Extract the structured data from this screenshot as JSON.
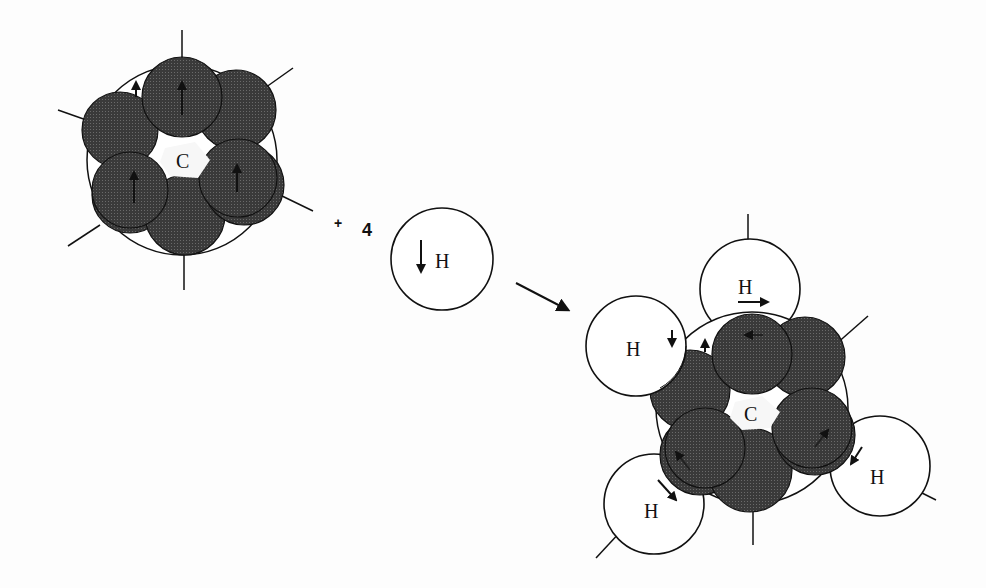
{
  "diagram": {
    "type": "reaction",
    "reactant_carbon": {
      "label": "C",
      "electron_spheres": 8,
      "spin_arrows": [
        "up",
        "up",
        "up",
        "up"
      ]
    },
    "operator": "+",
    "coefficient": "4",
    "reactant_hydrogen": {
      "label": "H",
      "spin_arrow": "down"
    },
    "reaction_arrow": "→",
    "product": {
      "center_label": "C",
      "hydrogens": [
        {
          "label": "H",
          "position": "top",
          "spin_arrow": "right"
        },
        {
          "label": "H",
          "position": "upper-left",
          "spin_arrow": "down"
        },
        {
          "label": "H",
          "position": "lower-left",
          "spin_arrow": "down-right"
        },
        {
          "label": "H",
          "position": "lower-right",
          "spin_arrow": "down-left"
        }
      ]
    },
    "colors": {
      "sphere_fill": "#3a3a3a",
      "outline": "#111111",
      "background": "#fdfdfd"
    }
  }
}
